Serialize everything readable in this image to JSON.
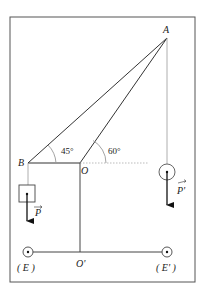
{
  "diagram": {
    "type": "physics-statics",
    "points": {
      "A": "A",
      "B": "B",
      "O": "O",
      "O_prime": "O'",
      "E": "( E )",
      "E_prime": "( E' )"
    },
    "angles": {
      "angle_B": "45°",
      "angle_O": "60°"
    },
    "forces": {
      "P": "P",
      "P_prime": "P'"
    },
    "colors": {
      "line": "#333333",
      "frame": "#555555",
      "guide": "#aaaaaa"
    }
  }
}
